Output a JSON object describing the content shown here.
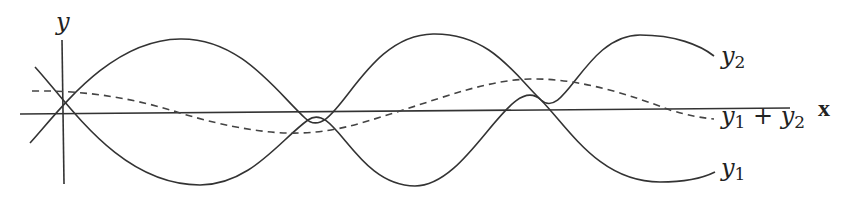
{
  "diagram": {
    "axes": {
      "y_label": "y",
      "x_label": "x"
    },
    "labels": {
      "y2": {
        "var": "y",
        "sub": "2"
      },
      "y1": {
        "var": "y",
        "sub": "1"
      },
      "sum": {
        "var1": "y",
        "sub1": "1",
        "op": " + ",
        "var2": "y",
        "sub2": "2"
      }
    },
    "curves": [
      {
        "name": "y1",
        "style": "solid",
        "description": "wave starting high at left, decreasing, troughs near x=200, 415, 660"
      },
      {
        "name": "y2",
        "style": "solid",
        "description": "wave starting low at left, increasing, peaks near x=180, 433, 640"
      },
      {
        "name": "y1 + y2",
        "style": "dashed",
        "description": "small-amplitude resultant wave, trough near x=300, peak near x=530"
      }
    ],
    "colors": {
      "line": "#333333",
      "background": "#ffffff"
    }
  }
}
